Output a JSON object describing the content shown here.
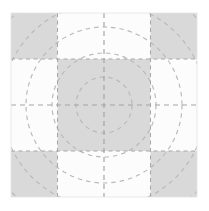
{
  "figure": {
    "title": "Nine-Patch Quilt Block Draft",
    "type": "geometric-pattern-diagram",
    "canvas": {
      "width": 209,
      "height": 211,
      "background": "#ffffff"
    }
  },
  "palette": {
    "background": "#ffffff",
    "light_patch": "#fcfcfc",
    "dark_patch": "#d9d9d9",
    "dash_stroke": "#b9b9b9",
    "grid_stroke": "#a8a8a8",
    "center_dash_stroke": "#a3a3a3"
  },
  "grid": {
    "columns": 4,
    "rows": 4,
    "x_edges": [
      11,
      57.5,
      104,
      150.5,
      197
    ],
    "y_edges": [
      13,
      59,
      105,
      151,
      197
    ],
    "cell_width": 46.5,
    "cell_height": 46
  },
  "patches": [
    {
      "name": "corner-top-left",
      "row": 0,
      "col": 0,
      "fill": "dark",
      "arc": "diagonal-nw"
    },
    {
      "name": "edge-top-left",
      "row": 0,
      "col": 1,
      "fill": "light",
      "arc": "arc-bottom"
    },
    {
      "name": "edge-top-right",
      "row": 0,
      "col": 2,
      "fill": "light",
      "arc": "arc-bottom"
    },
    {
      "name": "corner-top-right",
      "row": 0,
      "col": 3,
      "fill": "dark",
      "arc": "diagonal-ne"
    },
    {
      "name": "edge-left-upper",
      "row": 1,
      "col": 0,
      "fill": "light",
      "arc": "arc-right"
    },
    {
      "name": "center-upper-left",
      "row": 1,
      "col": 1,
      "fill": "dark",
      "arc": "circle-quadrant"
    },
    {
      "name": "center-upper-right",
      "row": 1,
      "col": 2,
      "fill": "dark",
      "arc": "circle-quadrant"
    },
    {
      "name": "edge-right-upper",
      "row": 1,
      "col": 3,
      "fill": "light",
      "arc": "arc-left"
    },
    {
      "name": "edge-left-lower",
      "row": 2,
      "col": 0,
      "fill": "light",
      "arc": "arc-right"
    },
    {
      "name": "center-lower-left",
      "row": 2,
      "col": 1,
      "fill": "dark",
      "arc": "circle-quadrant"
    },
    {
      "name": "center-lower-right",
      "row": 2,
      "col": 2,
      "fill": "dark",
      "arc": "circle-quadrant"
    },
    {
      "name": "edge-right-lower",
      "row": 2,
      "col": 3,
      "fill": "light",
      "arc": "arc-left"
    },
    {
      "name": "corner-bottom-left",
      "row": 3,
      "col": 0,
      "fill": "dark",
      "arc": "diagonal-sw"
    },
    {
      "name": "edge-bottom-left",
      "row": 3,
      "col": 1,
      "fill": "light",
      "arc": "arc-top"
    },
    {
      "name": "edge-bottom-right",
      "row": 3,
      "col": 2,
      "fill": "light",
      "arc": "arc-top"
    },
    {
      "name": "corner-bottom-right",
      "row": 3,
      "col": 3,
      "fill": "dark",
      "arc": "diagonal-se"
    }
  ],
  "chart_data": {
    "type": "scatter",
    "title": "Nine-Patch Quilt Block Draft",
    "xlabel": "",
    "ylabel": "",
    "xlim": [
      11,
      197
    ],
    "ylim": [
      13,
      197
    ],
    "grid": true,
    "legend": false,
    "center": {
      "x": 104,
      "y": 105
    },
    "circles": [
      {
        "name": "inner-circle",
        "radius": 28,
        "dashed": true
      },
      {
        "name": "mid-circle",
        "radius": 52,
        "dashed": true
      },
      {
        "name": "outer-circle",
        "radius": 78,
        "dashed": true
      },
      {
        "name": "outermost-circle",
        "radius": 102,
        "dashed": true
      },
      {
        "name": "corner-circle",
        "radius": 127,
        "dashed": true
      }
    ],
    "crosshair": {
      "horizontal_y": 105,
      "vertical_x": 104,
      "dashed": true
    },
    "gridlines": {
      "vertical_x": [
        57.5,
        104,
        150.5
      ],
      "horizontal_y": [
        59,
        105,
        151
      ],
      "dashed": true
    }
  },
  "annotations": {
    "units": "",
    "scale_note": ""
  }
}
